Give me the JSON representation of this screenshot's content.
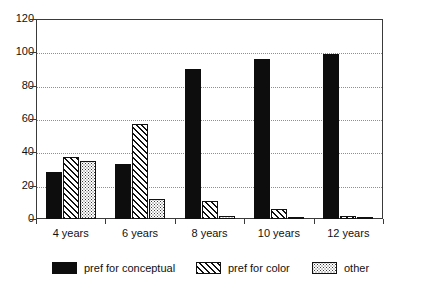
{
  "chart_data": {
    "type": "bar",
    "title": "",
    "xlabel": "",
    "ylabel": "",
    "ylim": [
      0,
      120
    ],
    "y_ticks": [
      0,
      20,
      40,
      60,
      80,
      100,
      120
    ],
    "grid": true,
    "legend_position": "bottom",
    "categories": [
      "4 years",
      "6 years",
      "8 years",
      "10 years",
      "12 years"
    ],
    "series": [
      {
        "name": "pref for conceptual",
        "pattern": "solid-black",
        "values": [
          28,
          33,
          90,
          96,
          99
        ]
      },
      {
        "name": "pref for color",
        "pattern": "diagonal-hatch",
        "values": [
          37,
          57,
          11,
          6,
          2
        ]
      },
      {
        "name": "other",
        "pattern": "stipple-dots",
        "values": [
          35,
          12,
          2,
          1.5,
          1.5
        ]
      }
    ]
  },
  "colors": {
    "series_conceptual": "#0d0d0d",
    "series_color": "#111111",
    "series_other": "#3b3b3b",
    "axis": "#3a3a3a",
    "gridline": "#8f8f8f",
    "background": "#ffffff"
  },
  "title_remnant": ""
}
